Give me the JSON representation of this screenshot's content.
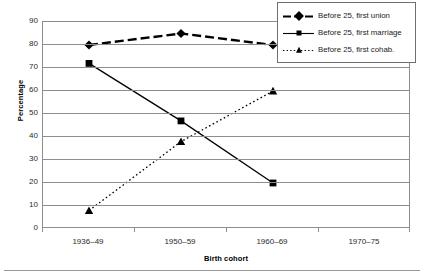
{
  "chart_data": {
    "type": "line",
    "title": "",
    "xlabel": "Birth cohort",
    "ylabel": "Percentage",
    "categories": [
      "1936–49",
      "1950–59",
      "1960–69",
      "1970–75"
    ],
    "ylim": [
      0,
      90
    ],
    "yticks": [
      0,
      10,
      20,
      30,
      40,
      50,
      60,
      70,
      80,
      90
    ],
    "ytick_labels": [
      "0",
      "10",
      "20",
      "30",
      "40",
      "50",
      "60",
      "70",
      "80",
      "90"
    ],
    "grid": "horizontal",
    "legend_position": "top-right",
    "series": [
      {
        "name": "Before 25, first union",
        "marker": "diamond",
        "linestyle": "dashed",
        "color": "#000000",
        "values": [
          80,
          85,
          80,
          null
        ]
      },
      {
        "name": "Before 25, first marriage",
        "marker": "square",
        "linestyle": "solid",
        "color": "#000000",
        "values": [
          72,
          47,
          20,
          null
        ]
      },
      {
        "name": "Before 25, first cohab.",
        "marker": "triangle",
        "linestyle": "dotted",
        "color": "#000000",
        "values": [
          8,
          38,
          60,
          null
        ]
      }
    ]
  },
  "legend": {
    "items": [
      {
        "label": "Before 25, first union"
      },
      {
        "label": "Before 25, first marriage"
      },
      {
        "label": "Before 25, first cohab."
      }
    ]
  },
  "axes": {
    "y_title": "Percentage",
    "x_title": "Birth cohort",
    "y_ticks": [
      "90",
      "80",
      "70",
      "60",
      "50",
      "40",
      "30",
      "20",
      "10",
      "0"
    ],
    "x_ticks": [
      "1936–49",
      "1950–59",
      "1960–69",
      "1970–75"
    ]
  },
  "colors": {
    "line": "#000000",
    "grid": "#8d8d8d",
    "frame": "#8d8d8d",
    "text": "#1a1a1a",
    "background": "#ffffff"
  }
}
